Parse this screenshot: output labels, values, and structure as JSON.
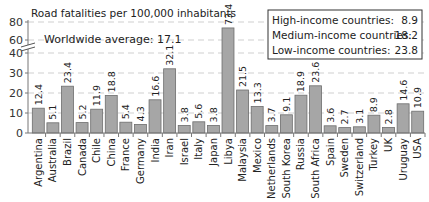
{
  "chart_data": {
    "type": "bar",
    "title": "Road fatalities per 100,000 inhabitants",
    "annotation": "Worldwide average: 17.1",
    "xlabel": "",
    "ylabel": "",
    "y_axis_break": {
      "from": 40,
      "to": 60
    },
    "yticks": [
      0,
      10,
      20,
      30,
      40,
      60,
      80
    ],
    "ylim": [
      0,
      80
    ],
    "grid": true,
    "categories": [
      "Argentina",
      "Australia",
      "Brazil",
      "Canada",
      "Chile",
      "China",
      "France",
      "Germany",
      "India",
      "Iran",
      "Israel",
      "Italy",
      "Japan",
      "Libya",
      "Malaysia",
      "Mexico",
      "Netherlands",
      "South Korea",
      "Russia",
      "South Africa",
      "Spain",
      "Sweden",
      "Switzerland",
      "Turkey",
      "UK",
      "Uruguay",
      "USA"
    ],
    "values": [
      12.4,
      5.1,
      23.4,
      5.2,
      11.9,
      18.8,
      5.4,
      4.3,
      16.6,
      32.1,
      3.8,
      5.6,
      3.8,
      73.4,
      21.5,
      13.3,
      3.7,
      9.1,
      18.9,
      23.6,
      3.6,
      2.7,
      3.1,
      8.9,
      2.8,
      14.6,
      10.9
    ],
    "value_labels": [
      "12.4",
      "5.1",
      "23.4",
      "5.2",
      "11.9",
      "18.8",
      "5.4",
      "4.3",
      "16.6",
      "32.1",
      "3.8",
      "5.6",
      "3.8",
      "73.4",
      "21.5",
      "13.3",
      "3.7",
      "9.1",
      "18.9",
      "23.6",
      "3.6",
      "2.7",
      "3.1",
      "8.9",
      "2.8",
      "14.6",
      "10.9"
    ],
    "legend": {
      "position": "top-right",
      "entries": [
        {
          "label": "High-income countries:",
          "value": "8.9"
        },
        {
          "label": "Medium-income countries:",
          "value": "18.2"
        },
        {
          "label": "Low-income countries:",
          "value": "23.8"
        }
      ]
    },
    "colors": {
      "bar_fill": "#a6a6a6",
      "bar_stroke": "#6e6e6e",
      "grid": "#cfcfcf",
      "axis": "#777777"
    }
  }
}
